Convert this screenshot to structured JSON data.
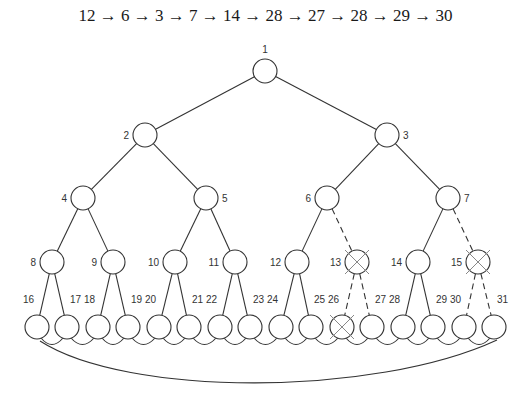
{
  "caption": "12 → 6 → 3 → 7 → 14 → 28 → 27 → 28 → 29 → 30",
  "path_sequence": [
    12,
    6,
    3,
    7,
    14,
    28,
    27,
    28,
    29,
    30
  ],
  "tree": {
    "node_radius": 12,
    "nodes": [
      {
        "id": 1,
        "x": 265,
        "y": 71,
        "label_side": "top",
        "crossed": false
      },
      {
        "id": 2,
        "x": 145,
        "y": 135,
        "label_side": "left",
        "crossed": false
      },
      {
        "id": 3,
        "x": 387,
        "y": 135,
        "label_side": "right",
        "crossed": false
      },
      {
        "id": 4,
        "x": 83,
        "y": 198,
        "label_side": "left",
        "crossed": false
      },
      {
        "id": 5,
        "x": 206,
        "y": 198,
        "label_side": "right",
        "crossed": false
      },
      {
        "id": 6,
        "x": 327,
        "y": 198,
        "label_side": "left",
        "crossed": false
      },
      {
        "id": 7,
        "x": 448,
        "y": 198,
        "label_side": "right",
        "crossed": false
      },
      {
        "id": 8,
        "x": 52,
        "y": 262,
        "label_side": "left",
        "crossed": false
      },
      {
        "id": 9,
        "x": 113,
        "y": 262,
        "label_side": "left",
        "crossed": false
      },
      {
        "id": 10,
        "x": 175,
        "y": 262,
        "label_side": "left",
        "crossed": false
      },
      {
        "id": 11,
        "x": 235,
        "y": 262,
        "label_side": "left",
        "crossed": false
      },
      {
        "id": 12,
        "x": 297,
        "y": 262,
        "label_side": "left",
        "crossed": false
      },
      {
        "id": 13,
        "x": 357,
        "y": 262,
        "label_side": "left",
        "crossed": true
      },
      {
        "id": 14,
        "x": 418,
        "y": 262,
        "label_side": "left",
        "crossed": false
      },
      {
        "id": 15,
        "x": 478,
        "y": 262,
        "label_side": "left",
        "crossed": true
      },
      {
        "id": 16,
        "x": 37,
        "y": 327,
        "label_side": "top-left",
        "crossed": false
      },
      {
        "id": 17,
        "x": 67,
        "y": 327,
        "label_side": "top-right",
        "crossed": false
      },
      {
        "id": 18,
        "x": 98,
        "y": 327,
        "label_side": "top-left",
        "crossed": false
      },
      {
        "id": 19,
        "x": 128,
        "y": 327,
        "label_side": "top-right",
        "crossed": false
      },
      {
        "id": 20,
        "x": 159,
        "y": 327,
        "label_side": "top-left",
        "crossed": false
      },
      {
        "id": 21,
        "x": 189,
        "y": 327,
        "label_side": "top-right",
        "crossed": false
      },
      {
        "id": 22,
        "x": 220,
        "y": 327,
        "label_side": "top-left",
        "crossed": false
      },
      {
        "id": 23,
        "x": 250,
        "y": 327,
        "label_side": "top-right",
        "crossed": false
      },
      {
        "id": 24,
        "x": 281,
        "y": 327,
        "label_side": "top-left",
        "crossed": false
      },
      {
        "id": 25,
        "x": 311,
        "y": 327,
        "label_side": "top-right",
        "crossed": false
      },
      {
        "id": 26,
        "x": 342,
        "y": 327,
        "label_side": "top-left",
        "crossed": true
      },
      {
        "id": 27,
        "x": 372,
        "y": 327,
        "label_side": "top-right",
        "crossed": false
      },
      {
        "id": 28,
        "x": 403,
        "y": 327,
        "label_side": "top-left",
        "crossed": false
      },
      {
        "id": 29,
        "x": 433,
        "y": 327,
        "label_side": "top-right",
        "crossed": false
      },
      {
        "id": 30,
        "x": 464,
        "y": 327,
        "label_side": "top-left",
        "crossed": false
      },
      {
        "id": 31,
        "x": 494,
        "y": 327,
        "label_side": "top-right",
        "crossed": false
      }
    ],
    "edges": [
      {
        "from": 1,
        "to": 2,
        "dashed": false
      },
      {
        "from": 1,
        "to": 3,
        "dashed": false
      },
      {
        "from": 2,
        "to": 4,
        "dashed": false
      },
      {
        "from": 2,
        "to": 5,
        "dashed": false
      },
      {
        "from": 3,
        "to": 6,
        "dashed": false
      },
      {
        "from": 3,
        "to": 7,
        "dashed": false
      },
      {
        "from": 4,
        "to": 8,
        "dashed": false
      },
      {
        "from": 4,
        "to": 9,
        "dashed": false
      },
      {
        "from": 5,
        "to": 10,
        "dashed": false
      },
      {
        "from": 5,
        "to": 11,
        "dashed": false
      },
      {
        "from": 6,
        "to": 12,
        "dashed": false
      },
      {
        "from": 6,
        "to": 13,
        "dashed": true
      },
      {
        "from": 7,
        "to": 14,
        "dashed": false
      },
      {
        "from": 7,
        "to": 15,
        "dashed": true
      },
      {
        "from": 8,
        "to": 16,
        "dashed": false
      },
      {
        "from": 8,
        "to": 17,
        "dashed": false
      },
      {
        "from": 9,
        "to": 18,
        "dashed": false
      },
      {
        "from": 9,
        "to": 19,
        "dashed": false
      },
      {
        "from": 10,
        "to": 20,
        "dashed": false
      },
      {
        "from": 10,
        "to": 21,
        "dashed": false
      },
      {
        "from": 11,
        "to": 22,
        "dashed": false
      },
      {
        "from": 11,
        "to": 23,
        "dashed": false
      },
      {
        "from": 12,
        "to": 24,
        "dashed": false
      },
      {
        "from": 12,
        "to": 25,
        "dashed": false
      },
      {
        "from": 13,
        "to": 26,
        "dashed": true
      },
      {
        "from": 13,
        "to": 27,
        "dashed": true
      },
      {
        "from": 14,
        "to": 28,
        "dashed": false
      },
      {
        "from": 14,
        "to": 29,
        "dashed": false
      },
      {
        "from": 15,
        "to": 30,
        "dashed": true
      },
      {
        "from": 15,
        "to": 31,
        "dashed": true
      }
    ],
    "leaf_ring": {
      "description": "leaves 16-31 linked in a ring: adjacent arcs between neighbors, plus a long arc from 31 back to 16"
    }
  },
  "colors": {
    "stroke": "#333333",
    "cross": "#888888",
    "text": "#1a1a1a"
  }
}
